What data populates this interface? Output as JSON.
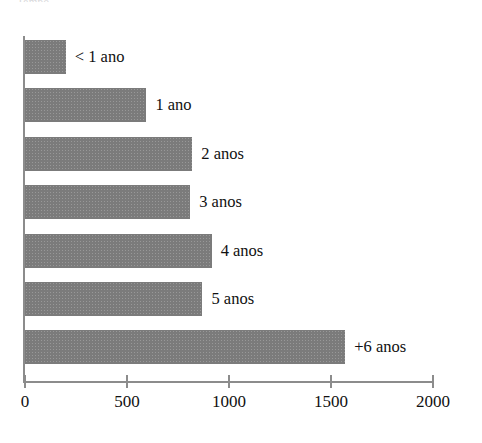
{
  "top_caption": "Tempo",
  "chart_data": {
    "type": "bar",
    "orientation": "horizontal",
    "title": "",
    "subtitle": "",
    "xlabel": "",
    "ylabel": "",
    "grid": false,
    "legend": false,
    "xlim": [
      0,
      2000
    ],
    "x_ticks": [
      0,
      500,
      1000,
      1500,
      2000
    ],
    "x_tick_labels": [
      "0",
      "500",
      "1000",
      "1500",
      "2000"
    ],
    "categories": [
      "< 1 ano",
      "1 ano",
      "2 anos",
      "3 anos",
      "4 anos",
      "5 anos",
      "+6 anos"
    ],
    "values": [
      200,
      595,
      820,
      810,
      915,
      870,
      1570
    ],
    "bar_color": "#7b7b7b",
    "axis_color": "#8c8c8c",
    "label_color": "#111111",
    "background": "#ffffff",
    "annotations": [
      {
        "text": "< 1 ano",
        "value": 200
      },
      {
        "text": "1 ano",
        "value": 595
      },
      {
        "text": "2 anos",
        "value": 820
      },
      {
        "text": "3 anos",
        "value": 810
      },
      {
        "text": "4 anos",
        "value": 915
      },
      {
        "text": "5 anos",
        "value": 870
      },
      {
        "text": "+6 anos",
        "value": 1570
      }
    ]
  }
}
